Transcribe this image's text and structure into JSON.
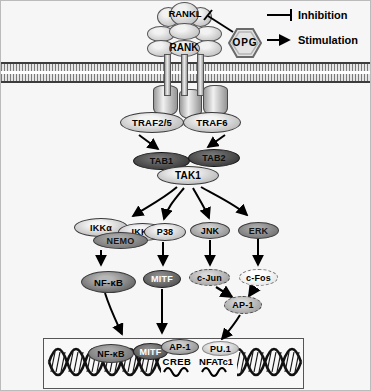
{
  "legend": {
    "inhibition_label": "Inhibition",
    "stimulation_label": "Stimulation"
  },
  "ligand_receptor": {
    "rankl": "RANKL",
    "rank": "RANK",
    "opg": "OPG"
  },
  "adapters": {
    "traf25": "TRAF2/5",
    "traf6": "TRAF6",
    "tab1": "TAB1",
    "tab2": "TAB2",
    "tak1": "TAK1"
  },
  "kinases": {
    "ikka_left": "IKKα",
    "ikka_right": "IKKα",
    "nemo": "NEMO",
    "p38": "P38",
    "jnk": "JNK",
    "erk": "ERK"
  },
  "transcription_factors": {
    "nfkb": "NF-κB",
    "mitf": "MITF",
    "cjun": "c-Jun",
    "cfos": "c-Fos",
    "ap1": "AP-1"
  },
  "nucleus": {
    "nfkb": "NF-κB",
    "mitf": "MITF",
    "ap1": "AP-1",
    "pu1": "PU.1",
    "creb": "CREB",
    "nfatc1": "NFATc1"
  },
  "colors": {
    "background": "#f6f6f6",
    "stroke": "#111111",
    "dark_oval": "#3a3a3a",
    "mid_oval": "#9a9a9a",
    "light_oval": "#e3e3e3"
  }
}
